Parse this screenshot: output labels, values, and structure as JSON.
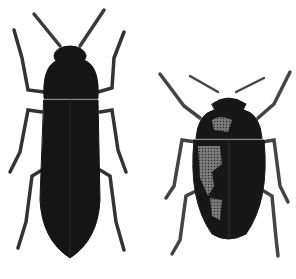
{
  "image": {
    "description": "Monochrome engraving-style illustration of two beetles on white background",
    "background": "#ffffff",
    "subjects": [
      {
        "name": "elongated-beetle",
        "position": "left",
        "color": "#141414"
      },
      {
        "name": "oval-beetle",
        "position": "right",
        "color": "#161616",
        "highlight": "#8a8a8a"
      }
    ]
  }
}
